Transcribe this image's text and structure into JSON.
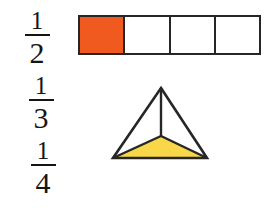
{
  "canvas": {
    "width": 275,
    "height": 210,
    "background": "#ffffff"
  },
  "colors": {
    "outline": "#262626",
    "text": "#151515",
    "bar_fill": "#f05a1e",
    "triangle_fill": "#f8d848",
    "unfilled": "#ffffff"
  },
  "fractions": [
    {
      "name": "one-half",
      "numerator": "1",
      "denominator": "2",
      "value": 0.5
    },
    {
      "name": "one-third",
      "numerator": "1",
      "denominator": "3",
      "value": 0.3333
    },
    {
      "name": "one-quarter",
      "numerator": "1",
      "denominator": "4",
      "value": 0.25
    }
  ],
  "bar_model": {
    "name": "four-part-bar",
    "total_parts": 4,
    "shaded_parts": 1,
    "fraction_shaded": "1/4",
    "cells": [
      {
        "index": 1,
        "shaded": true,
        "fill": "#f05a1e"
      },
      {
        "index": 2,
        "shaded": false,
        "fill": "#ffffff"
      },
      {
        "index": 3,
        "shaded": false,
        "fill": "#ffffff"
      },
      {
        "index": 4,
        "shaded": false,
        "fill": "#ffffff"
      }
    ]
  },
  "triangle_model": {
    "name": "three-part-triangle",
    "total_parts": 3,
    "shaded_parts": 1,
    "fraction_shaded": "1/3",
    "apex": {
      "x": 56,
      "y": 6
    },
    "left_vertex": {
      "x": 8,
      "y": 76
    },
    "right_vertex": {
      "x": 102,
      "y": 76
    },
    "centroid": {
      "x": 56,
      "y": 54
    },
    "regions": [
      {
        "index": 1,
        "position": "bottom",
        "shaded": true,
        "fill": "#f8d848"
      },
      {
        "index": 2,
        "position": "left",
        "shaded": false,
        "fill": "#ffffff"
      },
      {
        "index": 3,
        "position": "right",
        "shaded": false,
        "fill": "#ffffff"
      }
    ]
  }
}
